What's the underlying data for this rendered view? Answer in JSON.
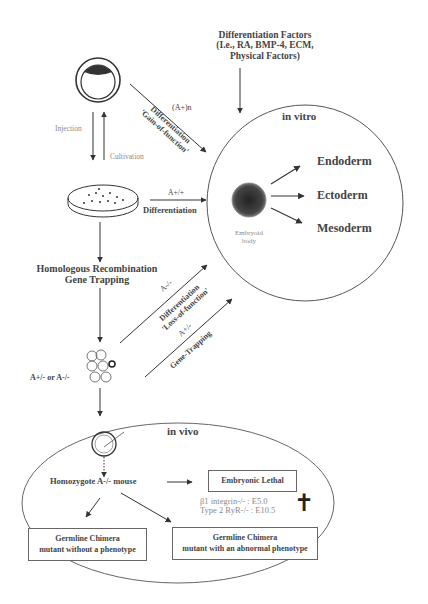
{
  "top": {
    "factors_line1": "Differentiation Factors",
    "factors_line2": "(I.e., RA, BMP-4, ECM,",
    "factors_line3": "Physical Factors)"
  },
  "left_flow": {
    "injection": "Injection",
    "cultivation": "Cultivation",
    "homologous_line1": "Homologous Recombination",
    "homologous_line2": "Gene Trapping",
    "genotype": "A+/- or A-/-"
  },
  "arrows": {
    "gain_top": "(A+)n",
    "gain_line1": "Differentiation",
    "gain_line2": "'Gain-of-function'",
    "wt_top": "A+/+",
    "wt_bottom": "Differentiation",
    "loss_top": "A-/-",
    "loss_line1": "Differentiation",
    "loss_line2": "'Loss-of-function'",
    "trap_top": "A+/-",
    "trap_bottom": "Gene-Trapping"
  },
  "in_vitro": {
    "title": "in vitro",
    "embryoid_line1": "Embryoid",
    "embryoid_line2": "body",
    "layers": [
      "Endoderm",
      "Ectoderm",
      "Mesoderm"
    ]
  },
  "in_vivo": {
    "title": "in vivo",
    "homozygote": "Homozygote A-/- mouse",
    "lethal_box": "Embryonic Lethal",
    "lethal_examples": [
      "β1 integrin-/-  : E5.0",
      "Type 2 RyR-/- : E10.5"
    ],
    "cross_symbol": "✝",
    "chimera_no_phenotype_line1": "Germline Chimera",
    "chimera_no_phenotype_line2": "mutant without a phenotype",
    "chimera_abnormal_line1": "Germline Chimera",
    "chimera_abnormal_line2": "mutant with an abnormal phenotype"
  }
}
